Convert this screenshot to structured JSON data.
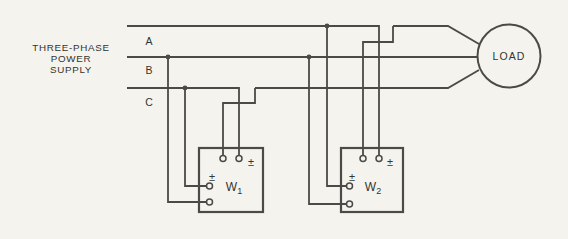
{
  "colors": {
    "background": "#f4f3ee",
    "line": "#4b4a46",
    "text": "#35342f"
  },
  "supply_label": {
    "lines": [
      "THREE-PHASE",
      "POWER",
      "SUPPLY"
    ]
  },
  "phase_labels": [
    {
      "label": "A"
    },
    {
      "label": "B"
    },
    {
      "label": "C"
    }
  ],
  "wattmeters": [
    {
      "name_base": "W",
      "name_sub": "1",
      "current_polarity_mark": "±",
      "voltage_polarity_mark": "±"
    },
    {
      "name_base": "W",
      "name_sub": "2",
      "current_polarity_mark": "±",
      "voltage_polarity_mark": "±"
    }
  ],
  "load": {
    "label": "LOAD"
  }
}
